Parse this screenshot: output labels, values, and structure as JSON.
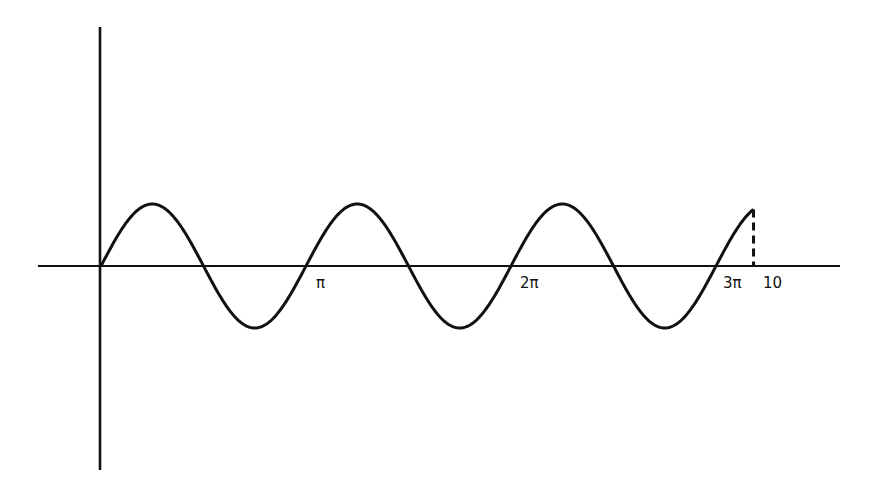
{
  "chart_data": {
    "type": "line",
    "title": "",
    "function": "sin(2x)",
    "x_range": [
      0,
      10
    ],
    "xlabel": "",
    "ylabel": "",
    "tick_labels": [
      "π",
      "2π",
      "3π",
      "10"
    ],
    "tick_values": [
      3.14159,
      6.28319,
      9.42478,
      10
    ],
    "amplitude": 1,
    "endpoint_marker": "dashed vertical line at x = 10",
    "grid": false,
    "legend": false
  },
  "labels": {
    "pi": "π",
    "two_pi": "2π",
    "three_pi": "3π",
    "ten": "10"
  },
  "colors": {
    "stroke": "#111111",
    "background": "#ffffff"
  }
}
